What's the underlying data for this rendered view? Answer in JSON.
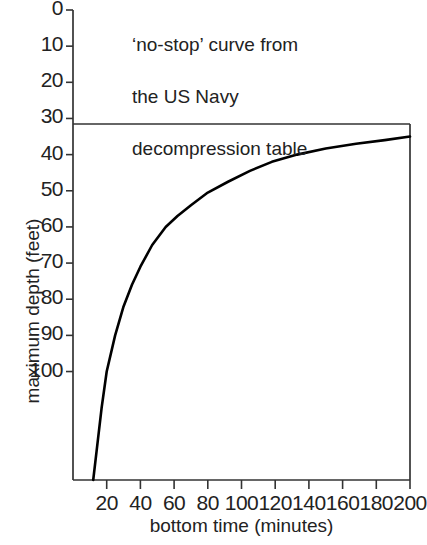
{
  "chart_data": {
    "type": "line",
    "title": "",
    "annotation": {
      "lines": [
        "‘no-stop’ curve from",
        "the US Navy",
        "decompression table"
      ]
    },
    "xlabel": "bottom time (minutes)",
    "ylabel": "maximum depth (feet)",
    "xlim": [
      0,
      200
    ],
    "ylim": [
      130,
      0
    ],
    "y_inverted": true,
    "grid": false,
    "legend": null,
    "xticks": [
      20,
      40,
      60,
      80,
      100,
      120,
      140,
      160,
      180,
      200
    ],
    "xtick_labels": [
      "20",
      "40",
      "60",
      "80",
      "100",
      "120",
      "140",
      "160",
      "180",
      "200"
    ],
    "yticks": [
      0,
      10,
      20,
      30,
      40,
      50,
      60,
      70,
      80,
      90,
      100
    ],
    "ytick_labels": [
      "0",
      "10",
      "20",
      "30",
      "40",
      "50",
      "60",
      "70",
      "80",
      "90",
      "100"
    ],
    "plot_box_top_depth": 30,
    "series": [
      {
        "name": "no-stop curve",
        "color": "#000000",
        "x": [
          12,
          14,
          17,
          20,
          25,
          30,
          35,
          40,
          47,
          55,
          62,
          70,
          80,
          92,
          105,
          118,
          133,
          150,
          168,
          185,
          200
        ],
        "y": [
          131,
          122,
          110,
          100,
          90,
          82,
          76,
          71,
          65,
          60,
          57,
          54,
          50.5,
          47.5,
          44.5,
          42,
          40,
          38.3,
          37,
          36,
          35
        ]
      }
    ]
  },
  "colors": {
    "ink": "#1a1a1a",
    "axis": "#333333",
    "curve": "#000000",
    "background": "#ffffff"
  }
}
